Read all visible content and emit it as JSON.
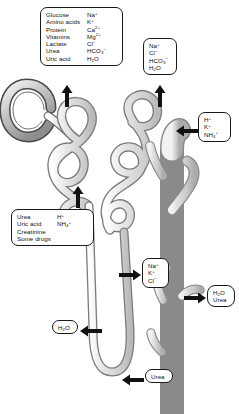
{
  "diagram": {
    "background_color": "#ffffff",
    "outline_color": "#1a1a1a",
    "tubule_fill": "#d8d8d8",
    "structures": [
      {
        "name": "glomerular-capsule",
        "label": "glomerular capsule"
      },
      {
        "name": "proximal-convoluted-tubule",
        "label": "proximal convoluted tubule"
      },
      {
        "name": "loop-of-henle",
        "label": "loop of Henle"
      },
      {
        "name": "distal-convoluted-tubule",
        "label": "distal convoluted tubule"
      },
      {
        "name": "collecting-duct",
        "label": "collecting duct"
      }
    ]
  },
  "callouts": {
    "pct_reabsorption": {
      "left_column": [
        "Glucose",
        "Amino acids",
        "Protein",
        "Vitamins",
        "Lactate",
        "Urea",
        "Uric acid"
      ],
      "right_column": [
        "Na+",
        "K+",
        "Ca2+",
        "Mg2+",
        "Cl-",
        "HCO3-",
        "H2O"
      ]
    },
    "dct_reabsorption": {
      "items": [
        "Na+",
        "Cl-",
        "HCO3-",
        "H2O"
      ]
    },
    "dct_secretion": {
      "items": [
        "H+",
        "K+",
        "NH4+"
      ]
    },
    "pct_secretion": {
      "left_column": [
        "Urea",
        "Uric acid",
        "Creatinine",
        "Some drugs"
      ],
      "right_column": [
        "H+",
        "NH4+"
      ]
    },
    "ascending_limb": {
      "items": [
        "Na+",
        "K+",
        "Cl-"
      ]
    },
    "collecting_duct": {
      "items": [
        "H2O",
        "Urea"
      ]
    },
    "descending_limb": {
      "items": [
        "H2O"
      ]
    },
    "thin_limb": {
      "items": [
        "Urea"
      ]
    }
  },
  "arrows": [
    {
      "name": "arrow-pct-reabsorption",
      "direction": "up"
    },
    {
      "name": "arrow-dct-reabsorption",
      "direction": "up"
    },
    {
      "name": "arrow-dct-secretion",
      "direction": "left"
    },
    {
      "name": "arrow-pct-secretion",
      "direction": "up"
    },
    {
      "name": "arrow-ascending-limb",
      "direction": "right"
    },
    {
      "name": "arrow-collecting-duct",
      "direction": "right"
    },
    {
      "name": "arrow-descending-limb",
      "direction": "left"
    },
    {
      "name": "arrow-thin-limb",
      "direction": "left"
    }
  ]
}
